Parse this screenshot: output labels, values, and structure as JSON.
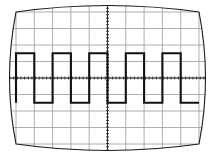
{
  "figure": {
    "name": "oscilloscope-crt-display",
    "background_color": "#ffffff"
  },
  "crt": {
    "bezel_color": "#1a1a1a",
    "bezel_stroke_width": 1.1,
    "screen_fill": "#ffffff",
    "barrel_bulge": 13,
    "bounds": {
      "left": 16,
      "top": 12,
      "right": 199,
      "bottom": 144
    }
  },
  "graticule": {
    "grid_color": "#9a9a9a",
    "grid_stroke_width": 0.8,
    "horizontal_divisions": 10,
    "vertical_divisions": 8,
    "center_axis_color": "#2a2a2a",
    "center_axis_stroke_width": 1.0,
    "tick_color": "#2a2a2a",
    "tick_stroke_width": 0.9,
    "minor_ticks_per_division": 5,
    "minor_tick_length": 3
  },
  "trace": {
    "color": "#111111",
    "stroke_width": 2.1,
    "waveform": "square",
    "cycles_visible": 5,
    "period_divisions": 2,
    "duty_cycle_percent": 50,
    "amplitude_divisions": 3,
    "top_level_division": 1.5,
    "bottom_level_division": -1.5,
    "vertical_center_division": 0
  },
  "chart_data": {
    "type": "line",
    "xlabel": "Time (divisions)",
    "ylabel": "Amplitude (divisions)",
    "xlim": [
      -5,
      5
    ],
    "ylim": [
      -4,
      4
    ],
    "grid": true,
    "legend": "none",
    "series": [
      {
        "name": "square-wave",
        "x": [
          -5.0,
          -5.0,
          -4.0,
          -4.0,
          -3.0,
          -3.0,
          -2.0,
          -2.0,
          -1.0,
          -1.0,
          0.0,
          0.0,
          1.0,
          1.0,
          2.0,
          2.0,
          3.0,
          3.0,
          4.0,
          4.0,
          5.0
        ],
        "y": [
          -1.5,
          1.5,
          1.5,
          -1.5,
          -1.5,
          1.5,
          1.5,
          -1.5,
          -1.5,
          1.5,
          1.5,
          -1.5,
          -1.5,
          1.5,
          1.5,
          -1.5,
          -1.5,
          1.5,
          1.5,
          -1.5,
          -1.5
        ]
      }
    ],
    "xticks": [
      -5,
      -4,
      -3,
      -2,
      -1,
      0,
      1,
      2,
      3,
      4,
      5
    ],
    "yticks": [
      -4,
      -3,
      -2,
      -1,
      0,
      1,
      2,
      3,
      4
    ],
    "annotations": []
  }
}
